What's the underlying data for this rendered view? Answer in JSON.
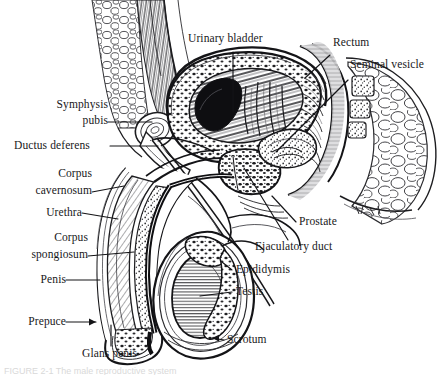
{
  "figure": {
    "background_color": "#ffffff",
    "ink_color": "#18181a",
    "caption_partial": "FIGURE 2-1  The male reproductive system"
  },
  "labels": {
    "urinary_bladder": "Urinary bladder",
    "rectum": "Rectum",
    "seminal_vesicle": "Seminal vesicle",
    "symphysis_line1": "Symphysis",
    "symphysis_line2": "pubis",
    "ductus_deferens": "Ductus deferens",
    "corpus_cavernosum_line1": "Corpus",
    "corpus_cavernosum_line2": "cavernosum",
    "urethra": "Urethra",
    "corpus_spongiosum_line1": "Corpus",
    "corpus_spongiosum_line2": "spongiosum",
    "penis": "Penis",
    "prepuce": "Prepuce",
    "glans_penis": "Glans penis",
    "prostate": "Prostate",
    "ejaculatory_duct": "Ejaculatory duct",
    "epididymis": "Epididymis",
    "testis": "Testis",
    "scrotum": "Scrotum"
  },
  "structures": [
    "urinary bladder",
    "rectum",
    "seminal vesicle",
    "symphysis pubis",
    "ductus deferens",
    "corpus cavernosum",
    "urethra",
    "corpus spongiosum",
    "penis",
    "prepuce",
    "glans penis",
    "prostate",
    "ejaculatory duct",
    "epididymis",
    "testis",
    "scrotum"
  ]
}
